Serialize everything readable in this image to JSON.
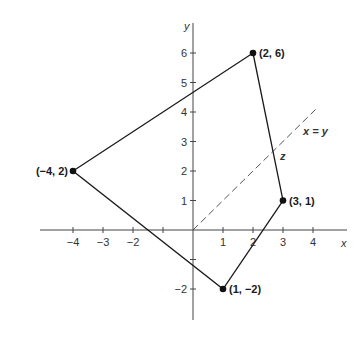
{
  "diagram": {
    "type": "coordinate-plane-polygon",
    "axes": {
      "x_label": "x",
      "y_label": "y",
      "x_range": [
        -5,
        5
      ],
      "y_range": [
        -3,
        6.7
      ],
      "x_ticks": [
        {
          "value": -4,
          "label": "−4"
        },
        {
          "value": -3,
          "label": "−3"
        },
        {
          "value": -2,
          "label": "−2"
        },
        {
          "value": -1,
          "label": ""
        },
        {
          "value": 1,
          "label": "1"
        },
        {
          "value": 2,
          "label": "2"
        },
        {
          "value": 3,
          "label": "3"
        },
        {
          "value": 4,
          "label": "4"
        }
      ],
      "y_ticks": [
        {
          "value": -2,
          "label": "−2"
        },
        {
          "value": -1,
          "label": ""
        },
        {
          "value": 1,
          "label": "1"
        },
        {
          "value": 2,
          "label": "2"
        },
        {
          "value": 3,
          "label": "3"
        },
        {
          "value": 4,
          "label": "4"
        },
        {
          "value": 5,
          "label": "5"
        },
        {
          "value": 6,
          "label": "6"
        }
      ]
    },
    "polygon_vertices": [
      {
        "x": 2,
        "y": 6,
        "label": "(2, 6)"
      },
      {
        "x": 3,
        "y": 1,
        "label": "(3, 1)"
      },
      {
        "x": 1,
        "y": -2,
        "label": "(1, −2)"
      },
      {
        "x": -4,
        "y": 2,
        "label": "(−4, 2)"
      }
    ],
    "reference_line": {
      "equation_label": "x = y",
      "from": [
        0,
        0
      ],
      "to": [
        4.1,
        4.1
      ],
      "style": "dashed"
    },
    "intersection_label": "z",
    "colors": {
      "stroke": "#1a1a1a",
      "axis": "#444444",
      "dashed": "#555555"
    }
  }
}
